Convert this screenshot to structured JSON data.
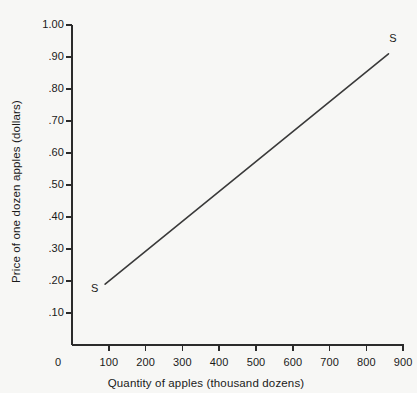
{
  "chart_data": {
    "type": "line",
    "title": "",
    "xlabel": "Quantity of apples (thousand dozens)",
    "ylabel": "Price of one dozen apples (dollars)",
    "xlim": [
      0,
      900
    ],
    "ylim": [
      0,
      1.0
    ],
    "grid": false,
    "legend": null,
    "xticks": [
      0,
      100,
      200,
      300,
      400,
      500,
      600,
      700,
      800,
      900
    ],
    "xticklabels": [
      "0",
      "100",
      "200",
      "300",
      "400",
      "500",
      "600",
      "700",
      "800",
      "900"
    ],
    "yticks": [
      0.1,
      0.2,
      0.3,
      0.4,
      0.5,
      0.6,
      0.7,
      0.8,
      0.9,
      1.0
    ],
    "yticklabels": [
      ".10",
      ".20",
      ".30",
      ".40",
      ".50",
      ".60",
      ".70",
      ".80",
      ".90",
      "1.00"
    ],
    "series": [
      {
        "name": "S",
        "type": "line",
        "color": "#3a3a3a",
        "x": [
          90,
          860
        ],
        "y": [
          0.19,
          0.91
        ]
      }
    ],
    "annotations": [
      {
        "text": "S",
        "x": 60,
        "y": 0.175,
        "name": "supply-curve-label-lower"
      },
      {
        "text": "S",
        "x": 870,
        "y": 0.955,
        "name": "supply-curve-label-upper"
      }
    ]
  },
  "style": {
    "background": "#f7f7f5",
    "axis_color": "#2b2b2b",
    "text_color": "#1a1a1a",
    "line_color": "#3a3a3a"
  }
}
